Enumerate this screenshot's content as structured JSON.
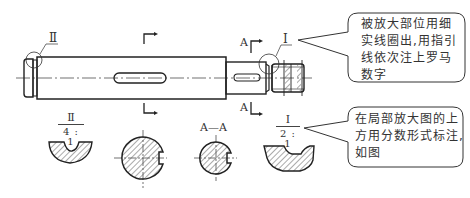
{
  "diagram": {
    "labels": {
      "detail_II": "Ⅱ",
      "detail_I": "Ⅰ",
      "section_A_top": "A",
      "section_A_bottom": "A",
      "section_AA": "A—A"
    },
    "enlarged_views": [
      {
        "id": "II",
        "numerator": "Ⅱ",
        "denominator": "4 : 1"
      },
      {
        "id": "I",
        "numerator": "Ⅰ",
        "denominator": "2 : 1"
      }
    ],
    "callouts": [
      {
        "id": "callout-circle-note",
        "text_lines": [
          "被放大部位用细",
          "实线圈出,用指引",
          "线依次注上罗马",
          "数字"
        ]
      },
      {
        "id": "callout-scale-note",
        "text_lines": [
          "在局部放大图的上",
          "方用分数形式标注,",
          "如图"
        ]
      }
    ],
    "colors": {
      "line": "#222222",
      "hatch": "#555555",
      "callout_border": "#333333"
    }
  }
}
